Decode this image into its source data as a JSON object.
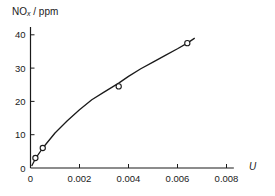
{
  "chart_data": {
    "type": "line",
    "title": "",
    "xlabel": "U",
    "ylabel": "NOx / ppm",
    "ylabel_main": "NO",
    "ylabel_sub": "x",
    "ylabel_unit": " / ppm",
    "xlim": [
      0,
      0.0085
    ],
    "ylim": [
      0,
      42
    ],
    "xticks": [
      0,
      0.002,
      0.004,
      0.006,
      0.008
    ],
    "xtick_labels": [
      "0",
      "0.002",
      "0.004",
      "0.006",
      "0.008"
    ],
    "yticks": [
      0,
      10,
      20,
      30,
      40
    ],
    "ytick_labels": [
      "0",
      "10",
      "20",
      "30",
      "40"
    ],
    "grid": false,
    "legend": null,
    "series": [
      {
        "name": "measured",
        "style": "open-circle-markers",
        "x": [
          0.0002,
          0.0005,
          0.0036,
          0.0064
        ],
        "y": [
          3,
          6,
          24.5,
          37.5
        ]
      },
      {
        "name": "fitted curve",
        "style": "solid-line",
        "x": [
          5e-05,
          0.0002,
          0.0005,
          0.001,
          0.0015,
          0.002,
          0.0025,
          0.003,
          0.0036,
          0.004,
          0.0045,
          0.005,
          0.0055,
          0.006,
          0.0064,
          0.0067
        ],
        "y": [
          0.6,
          2.8,
          6,
          10.5,
          14.2,
          17.5,
          20.5,
          22.8,
          25.5,
          27.5,
          29.8,
          31.8,
          33.8,
          35.8,
          37.5,
          39
        ]
      }
    ]
  }
}
